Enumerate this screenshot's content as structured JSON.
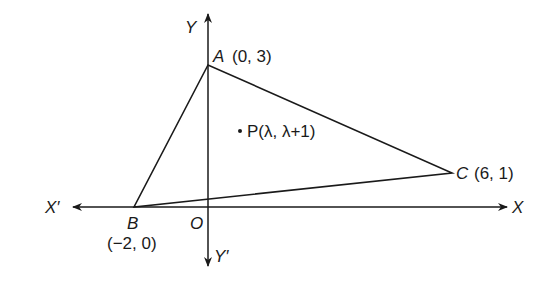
{
  "figure": {
    "axes": {
      "x_positive_label": "X",
      "x_negative_label": "X′",
      "y_positive_label": "Y",
      "y_negative_label": "Y′",
      "origin_label": "O"
    },
    "points": {
      "A": {
        "name": "A",
        "coords": "(0, 3)"
      },
      "B": {
        "name": "B",
        "coords": "(−2, 0)"
      },
      "C": {
        "name": "C",
        "coords": "(6, 1)"
      },
      "P": {
        "label": "P(λ, λ+1)"
      }
    },
    "shape": "triangle ABC with interior point P"
  }
}
